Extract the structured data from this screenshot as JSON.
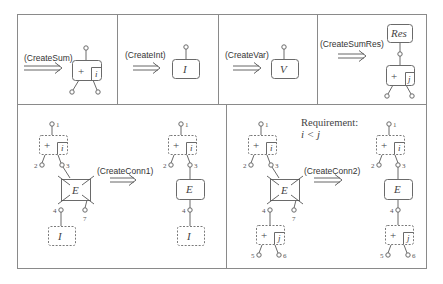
{
  "rules": [
    {
      "id": "create-sum",
      "label": "(CreateSum)",
      "result": {
        "type": "sum",
        "op": "+",
        "index": "i"
      }
    },
    {
      "id": "create-int",
      "label": "(CreateInt)",
      "result": {
        "type": "node",
        "symbol": "I"
      }
    },
    {
      "id": "create-var",
      "label": "(CreateVar)",
      "result": {
        "type": "node",
        "symbol": "V"
      }
    },
    {
      "id": "create-sum-res",
      "label": "(CreateSumRes)",
      "result": {
        "type": "res-sum",
        "res": "Res",
        "op": "+",
        "index": "j"
      }
    },
    {
      "id": "create-conn1",
      "label": "(CreateConn1)",
      "lhs": {
        "sum_op": "+",
        "sum_index": "i",
        "edge": "E",
        "target": "I",
        "ports": [
          "1",
          "2",
          "3",
          "4",
          "7"
        ]
      },
      "rhs": {
        "sum_op": "+",
        "sum_index": "i",
        "edge": "E",
        "target": "I",
        "ports": [
          "1",
          "2",
          "3",
          "4"
        ]
      }
    },
    {
      "id": "create-conn2",
      "label": "(CreateConn2)",
      "requirement_title": "Requirement:",
      "requirement_expr": "i < j",
      "lhs": {
        "sum_op": "+",
        "sum_index": "i",
        "edge": "E",
        "target_op": "+",
        "target_index": "j",
        "ports": [
          "1",
          "2",
          "3",
          "4",
          "5",
          "6",
          "7"
        ]
      },
      "rhs": {
        "sum_op": "+",
        "sum_index": "i",
        "edge": "E",
        "target_op": "+",
        "target_index": "j",
        "ports": [
          "1",
          "2",
          "3",
          "4",
          "5",
          "6"
        ]
      }
    }
  ],
  "symbols": {
    "plus": "+",
    "i": "i",
    "j": "j",
    "I": "I",
    "V": "V",
    "E": "E",
    "Res": "Res",
    "p1": "1",
    "p2": "2",
    "p3": "3",
    "p4": "4",
    "p5": "5",
    "p6": "6",
    "p7": "7"
  },
  "colors": {
    "stroke": "#6a6a6a",
    "frame": "#8a8a8a",
    "text": "#333333"
  }
}
